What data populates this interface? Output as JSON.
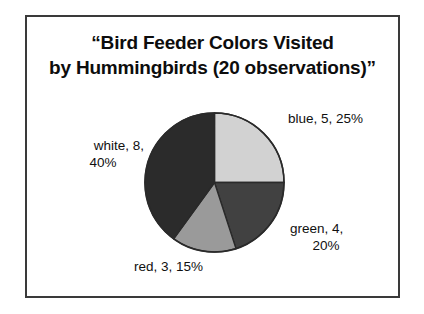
{
  "figure": {
    "border_color": "#3a3a3a",
    "background": "#ffffff"
  },
  "title": {
    "line1": "“Bird Feeder Colors Visited",
    "line2": "by Hummingbirds (20 observations)”"
  },
  "labels": {
    "blue": {
      "line1": "blue, 5, 25%",
      "line2": ""
    },
    "white": {
      "line1": "white, 8,",
      "line2": "40%"
    },
    "green": {
      "line1": "green, 4,",
      "line2": "20%"
    },
    "red": {
      "line1": "red, 3, 15%",
      "line2": ""
    }
  },
  "chart_data": {
    "type": "pie",
    "title": "“Bird Feeder Colors Visited by Hummingbirds (20 observations)”",
    "total_observations": 20,
    "total_label": "20 observations",
    "categories": [
      "blue",
      "green",
      "red",
      "white"
    ],
    "values": [
      5,
      4,
      3,
      8
    ],
    "percentages": [
      25,
      20,
      15,
      40
    ],
    "slice_fills": [
      "#d2d2d2",
      "#414141",
      "#9a9a9a",
      "#2b2b2b"
    ],
    "slice_stroke": "#2a2a2a",
    "start_angle_deg": 0,
    "direction": "clockwise",
    "slices": [
      {
        "name": "blue",
        "value": 5,
        "percent": 25,
        "label": "blue, 5, 25%",
        "fill": "#d2d2d2",
        "start_deg": 0,
        "end_deg": 90
      },
      {
        "name": "green",
        "value": 4,
        "percent": 20,
        "label": "green, 4, 20%",
        "fill": "#414141",
        "start_deg": 90,
        "end_deg": 162
      },
      {
        "name": "red",
        "value": 3,
        "percent": 15,
        "label": "red, 3, 15%",
        "fill": "#9a9a9a",
        "start_deg": 162,
        "end_deg": 216
      },
      {
        "name": "white",
        "value": 8,
        "percent": 40,
        "label": "white, 8, 40%",
        "fill": "#2b2b2b",
        "start_deg": 216,
        "end_deg": 360
      }
    ],
    "legend": "none",
    "labels_position": "outside",
    "grid": false
  }
}
